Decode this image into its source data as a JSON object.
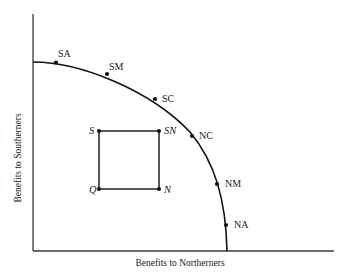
{
  "axes": {
    "x_label": "Benefits to Northerners",
    "y_label": "Benefits to Southerners"
  },
  "frontier_points": [
    {
      "id": "SA",
      "label": "SA"
    },
    {
      "id": "SM",
      "label": "SM"
    },
    {
      "id": "SC",
      "label": "SC"
    },
    {
      "id": "NC",
      "label": "NC"
    },
    {
      "id": "NM",
      "label": "NM"
    },
    {
      "id": "NA",
      "label": "NA"
    }
  ],
  "square_points": [
    {
      "id": "S",
      "label": "S"
    },
    {
      "id": "SN",
      "label": "SN"
    },
    {
      "id": "Q",
      "label": "Q"
    },
    {
      "id": "N",
      "label": "N"
    }
  ],
  "colors": {
    "line": "#111111",
    "axis": "#3a3a3a",
    "text": "#222222",
    "background": "#ffffff"
  }
}
